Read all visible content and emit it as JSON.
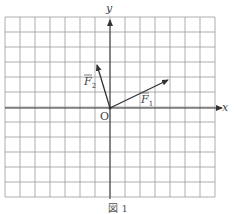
{
  "figure": {
    "caption": "図 1",
    "axes": {
      "x_label": "x",
      "y_label": "y",
      "origin_label": "O"
    },
    "grid": {
      "cols": 14,
      "rows": 12,
      "cell_px": 15,
      "origin_col": 7,
      "origin_row": 6
    },
    "vectors": [
      {
        "name": "F1",
        "label": "F",
        "subscript": "1",
        "dx": 4,
        "dy": 2
      },
      {
        "name": "F2",
        "label": "F",
        "subscript": "2",
        "dx": -1,
        "dy": 3
      }
    ],
    "colors": {
      "grid": "#9a9a9a",
      "axis": "#333333",
      "vector": "#333333"
    }
  }
}
